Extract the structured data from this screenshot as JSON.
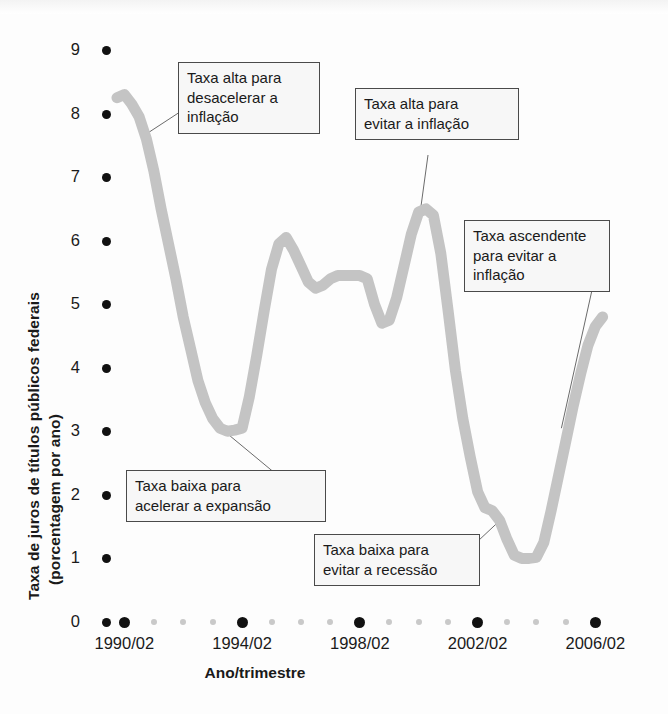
{
  "chart_data": {
    "type": "line",
    "title": "",
    "xlabel": "Ano/trimestre",
    "ylabel": "Taxa de juros de títulos públicos federais (porcentagem por ano)",
    "ylabel_line1": "Taxa de juros de títulos públicos federais",
    "ylabel_line2": "(porcentagem por ano)",
    "ylim": [
      0,
      9
    ],
    "xlim": [
      1990,
      2006.75
    ],
    "grid": false,
    "legend": "none",
    "series_color": "#c4c4c4",
    "axis_color": "#111111",
    "yticks": [
      0,
      1,
      2,
      3,
      4,
      5,
      6,
      7,
      8,
      9
    ],
    "ytick_labels": [
      "0",
      "1",
      "2",
      "3",
      "4",
      "5",
      "6",
      "7",
      "8",
      "9"
    ],
    "xtick_major_labels": [
      "1990/02",
      "1994/02",
      "1998/02",
      "2002/02",
      "2006/02"
    ],
    "xtick_major_values": [
      1990.25,
      1994.25,
      1998.25,
      2002.25,
      2006.25
    ],
    "xtick_minor_values": [
      1991.25,
      1992.25,
      1993.25,
      1995.25,
      1996.25,
      1997.25,
      1999.25,
      2000.25,
      2001.25,
      2003.25,
      2004.25,
      2005.25
    ],
    "x": [
      1990.0,
      1990.25,
      1990.5,
      1990.75,
      1991.0,
      1991.25,
      1991.5,
      1991.75,
      1992.0,
      1992.25,
      1992.5,
      1992.75,
      1993.0,
      1993.25,
      1993.5,
      1993.75,
      1994.0,
      1994.25,
      1994.5,
      1994.75,
      1995.0,
      1995.25,
      1995.5,
      1995.75,
      1996.0,
      1996.25,
      1996.5,
      1996.75,
      1997.0,
      1997.25,
      1997.5,
      1997.75,
      1998.0,
      1998.25,
      1998.5,
      1998.75,
      1999.0,
      1999.25,
      1999.5,
      1999.75,
      2000.0,
      2000.25,
      2000.5,
      2000.75,
      2001.0,
      2001.25,
      2001.5,
      2001.75,
      2002.0,
      2002.25,
      2002.5,
      2002.75,
      2003.0,
      2003.25,
      2003.5,
      2003.75,
      2004.0,
      2004.25,
      2004.5,
      2004.75,
      2005.0,
      2005.25,
      2005.5,
      2005.75,
      2006.0,
      2006.25,
      2006.5
    ],
    "y": [
      8.25,
      8.3,
      8.15,
      7.95,
      7.6,
      7.1,
      6.5,
      5.95,
      5.4,
      4.8,
      4.3,
      3.8,
      3.45,
      3.2,
      3.05,
      3.0,
      3.02,
      3.05,
      3.55,
      4.2,
      4.9,
      5.55,
      5.95,
      6.05,
      5.85,
      5.6,
      5.35,
      5.25,
      5.3,
      5.4,
      5.45,
      5.45,
      5.45,
      5.45,
      5.4,
      5.0,
      4.7,
      4.75,
      5.1,
      5.6,
      6.1,
      6.45,
      6.5,
      6.4,
      5.8,
      4.9,
      3.95,
      3.2,
      2.6,
      2.05,
      1.8,
      1.75,
      1.6,
      1.3,
      1.05,
      1.0,
      1.0,
      1.02,
      1.25,
      1.75,
      2.3,
      2.85,
      3.4,
      3.9,
      4.35,
      4.65,
      4.8
    ],
    "annotations": [
      {
        "id": "a1",
        "text": "Taxa alta para\ndesacelerar a\ninflação",
        "anchor_x": 1990.9,
        "anchor_y": 7.65
      },
      {
        "id": "a2",
        "text": "Taxa alta para\nevitar a inflação",
        "anchor_x": 2000.3,
        "anchor_y": 6.45
      },
      {
        "id": "a3",
        "text": "Taxa ascendente\npara evitar a\ninflação",
        "anchor_x": 2005.1,
        "anchor_y": 3.05
      },
      {
        "id": "a4",
        "text": "Taxa baixa para\nacelerar a expansão",
        "anchor_x": 1993.6,
        "anchor_y": 3.02
      },
      {
        "id": "a5",
        "text": "Taxa baixa para\nevitar a recessão",
        "anchor_x": 2002.9,
        "anchor_y": 1.55
      }
    ]
  }
}
